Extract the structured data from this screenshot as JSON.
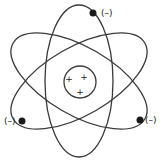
{
  "diagram": {
    "type": "atom-model",
    "nucleus": {
      "charges": [
        "+",
        "+",
        "+"
      ]
    },
    "electrons": [
      {
        "position": "top",
        "label": "(–)"
      },
      {
        "position": "left",
        "label": "(–)"
      },
      {
        "position": "right",
        "label": "(–)"
      }
    ],
    "orbit_count": 3,
    "colors": {
      "line": "#3a3a3a",
      "electron": "#1a1a1a",
      "background": "#ffffff"
    }
  }
}
